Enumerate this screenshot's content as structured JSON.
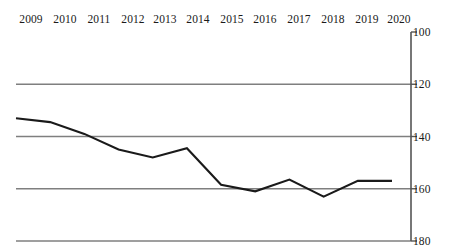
{
  "chart_data": {
    "type": "line",
    "title": "",
    "subtitle": "",
    "xlabel": "",
    "ylabel": "",
    "categories": [
      "2009",
      "2010",
      "2011",
      "2012",
      "2013",
      "2014",
      "2015",
      "2016",
      "2017",
      "2018",
      "2019",
      "2020"
    ],
    "series": [
      {
        "name": "",
        "values": [
          133,
          134.5,
          139,
          145,
          148,
          144.5,
          158.5,
          161,
          156.5,
          163,
          157,
          157
        ]
      }
    ],
    "x": [
      "2009",
      "2010",
      "2011",
      "2012",
      "2013",
      "2014",
      "2015",
      "2016",
      "2017",
      "2018",
      "2019",
      "2020"
    ],
    "ylim": [
      100,
      180
    ],
    "y_inverted": true,
    "yticks": [
      "100",
      "120",
      "140",
      "160",
      "180"
    ],
    "ytick_values": [
      100,
      120,
      140,
      160,
      180
    ],
    "grid": true,
    "gridlines_at": [
      120,
      140,
      160,
      180
    ],
    "legend": "none",
    "xaxis_position": "top",
    "yaxis_position": "right",
    "colors": {
      "series_line": "#1a1a1a",
      "gridline": "#7f7f7f",
      "axis": "#555555",
      "text": "#1a1a1a",
      "background": "#ffffff"
    }
  },
  "axes": {
    "x_tick_labels": [
      "2009",
      "2010",
      "2011",
      "2012",
      "2013",
      "2014",
      "2015",
      "2016",
      "2017",
      "2018",
      "2019",
      "2020"
    ],
    "y_tick_labels": [
      "100",
      "120",
      "140",
      "160",
      "180"
    ]
  }
}
